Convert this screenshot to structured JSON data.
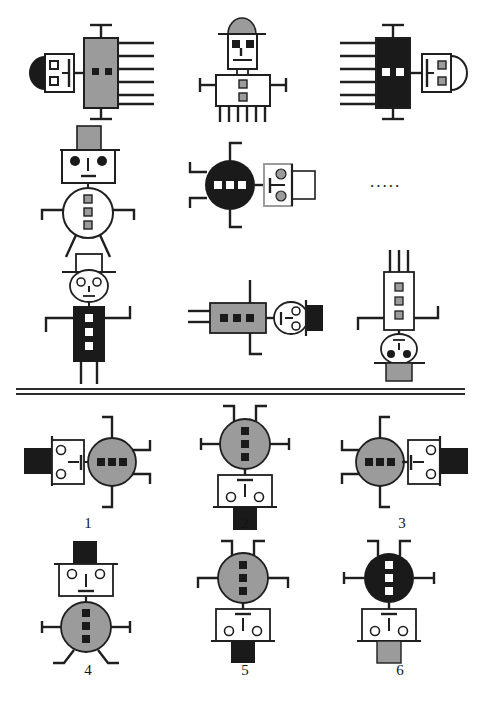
{
  "puzzle": {
    "title": "Figure matrix reasoning task",
    "type": "matrix-completion",
    "missing_cell_marker": ".....",
    "matrix_rows": 3,
    "matrix_cols": 3,
    "option_count": 6
  },
  "colors": {
    "black": "#1a1a1a",
    "gray": "#9b9b9b",
    "white": "#ffffff",
    "stroke": "#1f1f1f",
    "paper": "#ffffff"
  },
  "matrix": [
    [
      {
        "id": "cell-1-1",
        "name": "figure-row1-col1",
        "orientation": "rotated-left-facing",
        "hat": {
          "shape": "dome",
          "fill": "black",
          "position": "left"
        },
        "head": {
          "shape": "rect",
          "fill": "white",
          "eyes": "squares",
          "eye_count": 2
        },
        "body": {
          "shape": "rect",
          "fill": "gray",
          "buttons": "black-squares",
          "button_count": 2
        },
        "limbs": 6
      },
      {
        "id": "cell-1-2",
        "name": "figure-row1-col2",
        "orientation": "upright",
        "hat": {
          "shape": "dome",
          "fill": "gray",
          "position": "top"
        },
        "head": {
          "shape": "rect",
          "fill": "white",
          "eyes": "squares",
          "eye_count": 2
        },
        "body": {
          "shape": "rect",
          "fill": "white",
          "buttons": "gray-squares",
          "button_count": 2
        },
        "limbs": 8
      },
      {
        "id": "cell-1-3",
        "name": "figure-row1-col3",
        "orientation": "rotated-right-facing",
        "hat": {
          "shape": "dome",
          "fill": "white",
          "position": "right"
        },
        "head": {
          "shape": "rect",
          "fill": "white",
          "eyes": "gray-squares",
          "eye_count": 2
        },
        "body": {
          "shape": "rect",
          "fill": "black",
          "buttons": "white-squares",
          "button_count": 2
        },
        "limbs": 6
      }
    ],
    [
      {
        "id": "cell-2-1",
        "name": "figure-row2-col1",
        "orientation": "upright",
        "hat": {
          "shape": "rect",
          "fill": "gray",
          "position": "top"
        },
        "head": {
          "shape": "rect",
          "fill": "white",
          "eyes": "black-dots",
          "eye_count": 2
        },
        "body": {
          "shape": "circle",
          "fill": "white",
          "buttons": "gray-squares",
          "button_count": 3
        },
        "limbs": 4
      },
      {
        "id": "cell-2-2",
        "name": "figure-row2-col2",
        "orientation": "rotated-left-facing",
        "hat": {
          "shape": "rect",
          "fill": "white",
          "position": "right"
        },
        "head": {
          "shape": "rect",
          "fill": "white",
          "eyes": "gray-circles",
          "eye_count": 2
        },
        "body": {
          "shape": "circle",
          "fill": "black",
          "buttons": "white-squares",
          "button_count": 3
        },
        "limbs": 4
      },
      {
        "id": "cell-2-3",
        "name": "figure-row2-col3-missing",
        "orientation": "missing",
        "placeholder": "....."
      }
    ],
    [
      {
        "id": "cell-3-1",
        "name": "figure-row3-col1",
        "orientation": "upright",
        "hat": {
          "shape": "rect",
          "fill": "white",
          "position": "top"
        },
        "head": {
          "shape": "circle",
          "fill": "white",
          "eyes": "circles",
          "eye_count": 2
        },
        "body": {
          "shape": "rect",
          "fill": "black",
          "buttons": "white-squares",
          "button_count": 3
        },
        "limbs": 4
      },
      {
        "id": "cell-3-2",
        "name": "figure-row3-col2",
        "orientation": "rotated-right-facing",
        "hat": {
          "shape": "rect",
          "fill": "black",
          "position": "right"
        },
        "head": {
          "shape": "circle",
          "fill": "white",
          "eyes": "circles",
          "eye_count": 2
        },
        "body": {
          "shape": "rect",
          "fill": "gray",
          "buttons": "black-squares",
          "button_count": 3
        },
        "limbs": 4
      },
      {
        "id": "cell-3-3",
        "name": "figure-row3-col3",
        "orientation": "upside-down",
        "hat": {
          "shape": "rect",
          "fill": "gray",
          "position": "bottom"
        },
        "head": {
          "shape": "circle",
          "fill": "white",
          "eyes": "black-dots",
          "eye_count": 2
        },
        "body": {
          "shape": "rect",
          "fill": "white",
          "buttons": "gray-squares",
          "button_count": 3
        },
        "limbs": 4
      }
    ]
  ],
  "options": [
    {
      "number": "1",
      "name": "option-1",
      "orientation": "rotated-left-facing",
      "hat": {
        "shape": "rect",
        "fill": "black",
        "position": "left"
      },
      "head": {
        "shape": "rect",
        "fill": "white",
        "eyes": "circles",
        "eye_count": 2
      },
      "body": {
        "shape": "circle",
        "fill": "gray",
        "buttons": "black-squares",
        "button_count": 3
      },
      "limbs": 4
    },
    {
      "number": "2",
      "name": "option-2",
      "orientation": "upside-down",
      "hat": {
        "shape": "rect",
        "fill": "black",
        "position": "bottom"
      },
      "head": {
        "shape": "rect",
        "fill": "white",
        "eyes": "circles",
        "eye_count": 2
      },
      "body": {
        "shape": "circle",
        "fill": "gray",
        "buttons": "black-squares",
        "button_count": 3
      },
      "limbs": 4
    },
    {
      "number": "3",
      "name": "option-3",
      "orientation": "rotated-right-facing",
      "hat": {
        "shape": "rect",
        "fill": "black",
        "position": "right"
      },
      "head": {
        "shape": "rect",
        "fill": "white",
        "eyes": "circles",
        "eye_count": 2
      },
      "body": {
        "shape": "circle",
        "fill": "gray",
        "buttons": "black-squares",
        "button_count": 3
      },
      "limbs": 4
    },
    {
      "number": "4",
      "name": "option-4",
      "orientation": "upright",
      "hat": {
        "shape": "rect",
        "fill": "black",
        "position": "top"
      },
      "head": {
        "shape": "rect",
        "fill": "white",
        "eyes": "circles",
        "eye_count": 2
      },
      "body": {
        "shape": "circle",
        "fill": "gray",
        "buttons": "black-squares",
        "button_count": 3
      },
      "limbs": 4
    },
    {
      "number": "5",
      "name": "option-5",
      "orientation": "upside-down",
      "hat": {
        "shape": "rect",
        "fill": "black",
        "position": "bottom"
      },
      "head": {
        "shape": "rect",
        "fill": "white",
        "eyes": "circles",
        "eye_count": 2
      },
      "body": {
        "shape": "circle",
        "fill": "gray",
        "buttons": "black-squares",
        "button_count": 3
      },
      "limbs": 4
    },
    {
      "number": "6",
      "name": "option-6",
      "orientation": "upside-down",
      "hat": {
        "shape": "rect",
        "fill": "gray",
        "position": "bottom"
      },
      "head": {
        "shape": "rect",
        "fill": "white",
        "eyes": "circles",
        "eye_count": 2
      },
      "body": {
        "shape": "circle",
        "fill": "black",
        "buttons": "white-squares",
        "button_count": 3
      },
      "limbs": 4
    }
  ]
}
